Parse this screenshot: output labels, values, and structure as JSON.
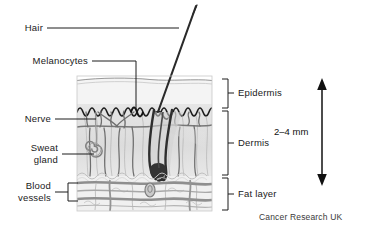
{
  "figure": {
    "credit": "Cancer Research UK"
  },
  "left_labels": [
    {
      "id": "hair",
      "text": "Hair"
    },
    {
      "id": "melanocytes",
      "text": "Melanocytes"
    },
    {
      "id": "nerve",
      "text": "Nerve"
    },
    {
      "id": "sweat-gland-line1",
      "text": "Sweat"
    },
    {
      "id": "sweat-gland-line2",
      "text": "gland"
    },
    {
      "id": "blood-vessels-line1",
      "text": "Blood"
    },
    {
      "id": "blood-vessels-line2",
      "text": "vessels"
    }
  ],
  "right_labels": [
    {
      "id": "epidermis",
      "text": "Epidermis"
    },
    {
      "id": "dermis",
      "text": "Dermis"
    },
    {
      "id": "fat-layer",
      "text": "Fat layer"
    }
  ],
  "scale": {
    "text": "2–4 mm"
  },
  "colors": {
    "epidermis_fill": "#f3f3f3",
    "dermis_fill": "#dedede",
    "fat_fill": "#efefef",
    "outline": "#8a8a8a",
    "dark_line": "#2b2b2b",
    "vessel": "#8c8c8c",
    "hair": "#3b3b3b",
    "background": "#ffffff",
    "text": "#1a1a1a"
  }
}
